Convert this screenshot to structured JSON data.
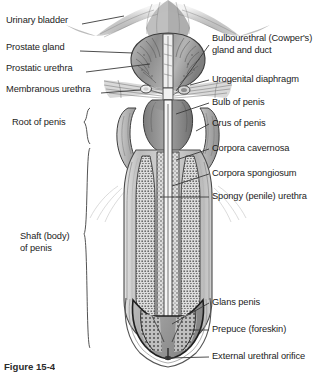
{
  "figure": {
    "caption": "Figure 15-4",
    "background_color": "#ffffff",
    "line_color": "#3a3a3a",
    "text_color": "#1c1c1c"
  },
  "labels_left": [
    {
      "id": "urinary-bladder",
      "text": "Urinary bladder",
      "x": 6,
      "y": 20,
      "leader": {
        "x1": 82,
        "y1": 24,
        "x2": 122,
        "y2": 17
      }
    },
    {
      "id": "prostate-gland",
      "text": "Prostate gland",
      "x": 6,
      "y": 47,
      "leader": {
        "x1": 80,
        "y1": 51,
        "x2": 131,
        "y2": 52
      }
    },
    {
      "id": "prostatic-urethra",
      "text": "Prostatic urethra",
      "x": 6,
      "y": 68,
      "leader": {
        "x1": 86,
        "y1": 72,
        "x2": 148,
        "y2": 64
      }
    },
    {
      "id": "membranous-urethra",
      "text": "Membranous urethra",
      "x": 6,
      "y": 89,
      "leader": {
        "x1": 101,
        "y1": 93,
        "x2": 139,
        "y2": 90
      }
    }
  ],
  "labels_brace": [
    {
      "id": "root-of-penis",
      "text": "Root of penis",
      "x": 12,
      "y": 122,
      "lines": [
        "Root of penis"
      ]
    },
    {
      "id": "shaft-of-penis",
      "text": "Shaft (body) of penis",
      "x": 20,
      "y": 237,
      "lines": [
        "Shaft (body)",
        "of penis"
      ]
    }
  ],
  "labels_right": [
    {
      "id": "bulbourethral-gland",
      "text": "Bulbourethral (Cowper's) gland and duct",
      "lines": [
        "Bulbourethral (Cowper's)",
        "gland and duct"
      ],
      "x": 212,
      "y": 38,
      "leader": {
        "x1": 209,
        "y1": 44,
        "x2": 173,
        "y2": 92
      }
    },
    {
      "id": "urogenital-diaphragm",
      "text": "Urogenital diaphragm",
      "lines": [
        "Urogenital diaphragm"
      ],
      "x": 212,
      "y": 76,
      "leader": {
        "x1": 209,
        "y1": 80,
        "x2": 183,
        "y2": 86
      }
    },
    {
      "id": "bulb-of-penis",
      "text": "Bulb of penis",
      "lines": [
        "Bulb of penis"
      ],
      "x": 212,
      "y": 99,
      "leader": {
        "x1": 209,
        "y1": 103,
        "x2": 172,
        "y2": 115
      }
    },
    {
      "id": "crus-of-penis",
      "text": "Crus of penis",
      "lines": [
        "Crus of penis"
      ],
      "x": 212,
      "y": 120,
      "leader": {
        "x1": 209,
        "y1": 124,
        "x2": 186,
        "y2": 128
      }
    },
    {
      "id": "corpora-cavernosa",
      "text": "Corpora cavernosa",
      "lines": [
        "Corpora cavernosa"
      ],
      "x": 212,
      "y": 145,
      "leader": {
        "x1": 209,
        "y1": 149,
        "x2": 178,
        "y2": 157
      }
    },
    {
      "id": "corpora-spongiosum",
      "text": "Corpora spongiosum",
      "lines": [
        "Corpora spongiosum"
      ],
      "x": 212,
      "y": 170,
      "leader": {
        "x1": 209,
        "y1": 174,
        "x2": 172,
        "y2": 182
      }
    },
    {
      "id": "spongy-urethra",
      "text": "Spongy (penile) urethra",
      "lines": [
        "Spongy (penile) urethra"
      ],
      "x": 212,
      "y": 193,
      "leader": {
        "x1": 209,
        "y1": 197,
        "x2": 158,
        "y2": 197
      }
    },
    {
      "id": "glans-penis",
      "text": "Glans penis",
      "lines": [
        "Glans penis"
      ],
      "x": 212,
      "y": 299,
      "leader": {
        "x1": 209,
        "y1": 303,
        "x2": 172,
        "y2": 322
      }
    },
    {
      "id": "prepuce",
      "text": "Prepuce (foreskin)",
      "lines": [
        "Prepuce (foreskin)"
      ],
      "x": 212,
      "y": 326,
      "leader": {
        "x1": 209,
        "y1": 330,
        "x2": 186,
        "y2": 330
      }
    },
    {
      "id": "external-urethral-orifice",
      "text": "External urethral orifice",
      "lines": [
        "External urethral orifice"
      ],
      "x": 212,
      "y": 353,
      "leader": {
        "x1": 209,
        "y1": 357,
        "x2": 163,
        "y2": 357
      }
    }
  ],
  "anatomy_structures": [
    "urinary-bladder-neck",
    "prostate-gland",
    "prostatic-urethra",
    "membranous-urethra",
    "urogenital-diaphragm",
    "bulbourethral-gland",
    "bulb-of-penis",
    "crus-of-penis-left",
    "crus-of-penis-right",
    "corpora-cavernosa-left",
    "corpora-cavernosa-right",
    "corpus-spongiosum",
    "spongy-urethra",
    "glans-penis",
    "prepuce",
    "external-urethral-orifice"
  ]
}
